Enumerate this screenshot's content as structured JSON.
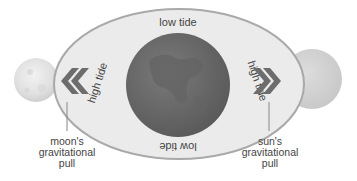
{
  "diagram": {
    "title": "",
    "labels": {
      "top": "low tide",
      "bottom": "low tide",
      "left": "high tide",
      "right": "high tide"
    },
    "captions": {
      "moon": [
        "moon's",
        "gravitational",
        "pull"
      ],
      "sun": [
        "sun's",
        "gravitational",
        "pull"
      ]
    },
    "bodies": {
      "moon": {
        "name": "moon"
      },
      "earth": {
        "name": "earth"
      },
      "sun": {
        "name": "sun"
      }
    },
    "arrows": {
      "left": "«",
      "right": "»"
    },
    "colors": {
      "water_fill": "#ebebeb",
      "water_stroke": "#a9a9a9",
      "earth": "#6e6e6e",
      "earth_land": "#5f5f5f",
      "moon": "#dedede",
      "sun": "#cfcfcf",
      "chevron": "#6d6d6d",
      "text": "#444444"
    }
  }
}
